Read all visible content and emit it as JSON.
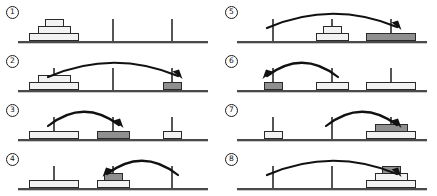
{
  "figure": {
    "panel_count": 8,
    "peg_count": 3,
    "disk_sizes": [
      "large",
      "medium",
      "small"
    ],
    "colors": {
      "disk_light": "#f2f2f2",
      "disk_dark": "#8f8f8f",
      "outline": "#2a2a2a",
      "peg": "#555555",
      "ground": "#4a4a4a",
      "background": "#ffffff"
    }
  },
  "panels": [
    {
      "number": "1",
      "label": "1",
      "arrow": null,
      "pegs": [
        {
          "disks": [
            {
              "size": "large",
              "tone": "light"
            },
            {
              "size": "medium",
              "tone": "light"
            },
            {
              "size": "small",
              "tone": "light"
            }
          ]
        },
        {
          "disks": []
        },
        {
          "disks": []
        }
      ]
    },
    {
      "number": "2",
      "label": "2",
      "arrow": {
        "from": 0,
        "to": 2,
        "direction": "right"
      },
      "pegs": [
        {
          "disks": [
            {
              "size": "large",
              "tone": "light"
            },
            {
              "size": "medium",
              "tone": "light"
            }
          ]
        },
        {
          "disks": []
        },
        {
          "disks": [
            {
              "size": "small",
              "tone": "dark"
            }
          ]
        }
      ]
    },
    {
      "number": "3",
      "label": "3",
      "arrow": {
        "from": 0,
        "to": 1,
        "direction": "right"
      },
      "pegs": [
        {
          "disks": [
            {
              "size": "large",
              "tone": "light"
            }
          ]
        },
        {
          "disks": [
            {
              "size": "medium",
              "tone": "dark"
            }
          ]
        },
        {
          "disks": [
            {
              "size": "small",
              "tone": "light"
            }
          ]
        }
      ]
    },
    {
      "number": "4",
      "label": "4",
      "arrow": {
        "from": 2,
        "to": 1,
        "direction": "left"
      },
      "pegs": [
        {
          "disks": [
            {
              "size": "large",
              "tone": "light"
            }
          ]
        },
        {
          "disks": [
            {
              "size": "medium",
              "tone": "light"
            },
            {
              "size": "small",
              "tone": "dark"
            }
          ]
        },
        {
          "disks": []
        }
      ]
    },
    {
      "number": "5",
      "label": "5",
      "arrow": {
        "from": 0,
        "to": 2,
        "direction": "right"
      },
      "pegs": [
        {
          "disks": []
        },
        {
          "disks": [
            {
              "size": "medium",
              "tone": "light"
            },
            {
              "size": "small",
              "tone": "light"
            }
          ]
        },
        {
          "disks": [
            {
              "size": "large",
              "tone": "dark"
            }
          ]
        }
      ]
    },
    {
      "number": "6",
      "label": "6",
      "arrow": {
        "from": 1,
        "to": 0,
        "direction": "left"
      },
      "pegs": [
        {
          "disks": [
            {
              "size": "small",
              "tone": "dark"
            }
          ]
        },
        {
          "disks": [
            {
              "size": "medium",
              "tone": "light"
            }
          ]
        },
        {
          "disks": [
            {
              "size": "large",
              "tone": "light"
            }
          ]
        }
      ]
    },
    {
      "number": "7",
      "label": "7",
      "arrow": {
        "from": 1,
        "to": 2,
        "direction": "right"
      },
      "pegs": [
        {
          "disks": [
            {
              "size": "small",
              "tone": "light"
            }
          ]
        },
        {
          "disks": []
        },
        {
          "disks": [
            {
              "size": "large",
              "tone": "light"
            },
            {
              "size": "medium",
              "tone": "dark"
            }
          ]
        }
      ]
    },
    {
      "number": "8",
      "label": "8",
      "arrow": {
        "from": 0,
        "to": 2,
        "direction": "right"
      },
      "pegs": [
        {
          "disks": []
        },
        {
          "disks": []
        },
        {
          "disks": [
            {
              "size": "large",
              "tone": "light"
            },
            {
              "size": "medium",
              "tone": "light"
            },
            {
              "size": "small",
              "tone": "dark"
            }
          ]
        }
      ]
    }
  ]
}
